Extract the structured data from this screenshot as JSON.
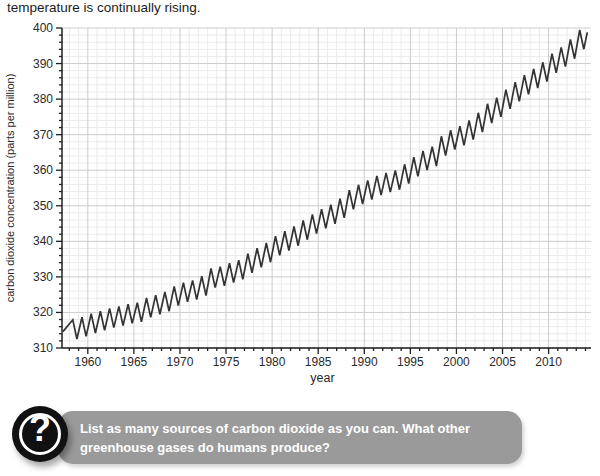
{
  "page": {
    "top_text": "temperature is continually rising."
  },
  "colors": {
    "page_bg": "#ffffff",
    "text": "#1c1c1c",
    "axis": "#1f1f1f",
    "tick_label": "#2a2a2a",
    "grid_minor": "#ebebeb",
    "grid_major": "#cccccc",
    "line": "#333333",
    "box_bg": "#9a9a9a",
    "box_text": "#ffffff",
    "icon_bg": "#111111",
    "icon_ring": "#ffffff"
  },
  "chart_data": {
    "type": "line",
    "title": "",
    "xlabel": "year",
    "ylabel": "carbon dioxide concentration (parts per million)",
    "xlim": [
      1957.2,
      2014.6
    ],
    "ylim": [
      310,
      400
    ],
    "grid": "minor-and-major",
    "legend": "none",
    "x_major_ticks": [
      1960,
      1965,
      1970,
      1975,
      1980,
      1985,
      1990,
      1995,
      2000,
      2005,
      2010
    ],
    "x_minor_step": 1,
    "y_major_ticks": [
      310,
      320,
      330,
      340,
      350,
      360,
      370,
      380,
      390,
      400
    ],
    "y_minor_step": 2,
    "series": [
      {
        "name": "atmospheric CO2 concentration (Keeling curve, seasonal cycle)",
        "years": [
          1958,
          1959,
          1960,
          1961,
          1962,
          1963,
          1964,
          1965,
          1966,
          1967,
          1968,
          1969,
          1970,
          1971,
          1972,
          1973,
          1974,
          1975,
          1976,
          1977,
          1978,
          1979,
          1980,
          1981,
          1982,
          1983,
          1984,
          1985,
          1986,
          1987,
          1988,
          1989,
          1990,
          1991,
          1992,
          1993,
          1994,
          1995,
          1996,
          1997,
          1998,
          1999,
          2000,
          2001,
          2002,
          2003,
          2004,
          2005,
          2006,
          2007,
          2008,
          2009,
          2010,
          2011,
          2012,
          2013
        ],
        "annual_means": [
          315.23,
          315.97,
          316.91,
          317.64,
          318.45,
          318.99,
          319.62,
          320.04,
          321.37,
          322.18,
          323.05,
          324.62,
          325.68,
          326.32,
          327.46,
          329.68,
          330.19,
          331.12,
          332.03,
          333.84,
          335.41,
          336.84,
          338.76,
          340.12,
          341.48,
          343.15,
          344.87,
          346.35,
          347.61,
          349.31,
          351.69,
          353.2,
          354.45,
          355.7,
          356.54,
          357.21,
          358.96,
          360.97,
          362.74,
          363.88,
          366.84,
          368.54,
          369.71,
          371.32,
          373.45,
          375.98,
          377.7,
          379.98,
          382.09,
          384.02,
          385.83,
          387.64,
          390.1,
          391.85,
          394.06,
          396.74
        ],
        "seasonal_amplitude": 2.7,
        "peak_phase": 0.37,
        "trough_phase": 0.82,
        "start_point": [
          1957.3,
          314.6
        ],
        "tail_points": [
          [
            2014.2,
            398.8
          ]
        ]
      }
    ]
  },
  "question_box": {
    "icon": "question-mark-icon",
    "question_mark": "?",
    "text": "List as many sources of carbon dioxide as you can. What other greenhouse gases do humans produce?"
  }
}
